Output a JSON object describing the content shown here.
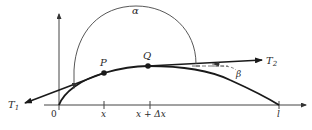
{
  "diagram": {
    "type": "string-tension-diagram",
    "colors": {
      "ink": "#1a1a1a",
      "thin_line": "#444444",
      "background": "#ffffff"
    },
    "axes": {
      "origin_label": "0",
      "x_ticks": [
        {
          "label": "x"
        },
        {
          "label": "x + Δx"
        },
        {
          "label": "l"
        }
      ]
    },
    "points": {
      "P": {
        "label": "P"
      },
      "Q": {
        "label": "Q"
      }
    },
    "tensions": {
      "T1": {
        "label": "T",
        "subscript": "1"
      },
      "T2": {
        "label": "T",
        "subscript": "2"
      }
    },
    "angles": {
      "alpha": {
        "label": "α"
      },
      "beta": {
        "label": "β"
      }
    }
  }
}
